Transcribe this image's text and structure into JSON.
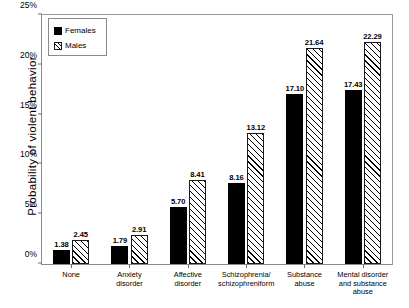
{
  "chart_data": {
    "type": "bar",
    "title": "",
    "xlabel": "",
    "ylabel": "Probability of violent behavior",
    "ylim": [
      0,
      25
    ],
    "ytick_labels": [
      "0%",
      "5%",
      "10%",
      "15%",
      "20%",
      "25%"
    ],
    "ytick_values": [
      0,
      5,
      10,
      15,
      20,
      25
    ],
    "grid": false,
    "legend_position": "top-left",
    "categories": [
      "None",
      "Anxiety\ndisorder",
      "Affective\ndisorder",
      "Schizophrenia/\nschizophreniform",
      "Substance\nabuse",
      "Mental disorder\nand substance\nabuse"
    ],
    "series": [
      {
        "name": "Females",
        "style": "solid-black",
        "values": [
          1.38,
          1.79,
          5.7,
          8.16,
          17.1,
          17.43
        ],
        "labels": [
          "1.38",
          "1.79",
          "5.70",
          "8.16",
          "17.10",
          "17.43"
        ]
      },
      {
        "name": "Males",
        "style": "diagonal-hatch",
        "values": [
          2.45,
          2.91,
          8.41,
          13.12,
          21.64,
          22.29
        ],
        "labels": [
          "2.45",
          "2.91",
          "8.41",
          "13.12",
          "21.64",
          "22.29"
        ]
      }
    ]
  },
  "legend": {
    "items": [
      {
        "label": "Females",
        "swatch": "solid-black-swatch"
      },
      {
        "label": "Males",
        "swatch": "hatched-swatch"
      }
    ]
  },
  "colors": {
    "females": "#000000",
    "males_fill": "#ffffff",
    "males_hatch": "#000000",
    "frame": "#8a8a8a",
    "background": "#ffffff"
  }
}
